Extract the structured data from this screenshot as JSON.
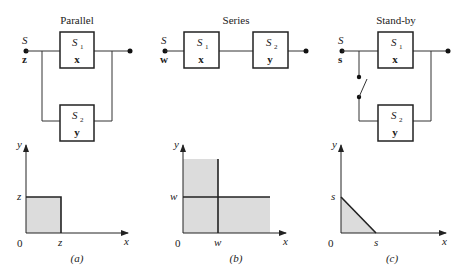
{
  "panels": [
    {
      "id": "a",
      "title": "Parallel",
      "caption": "(a)",
      "input_label": "S",
      "input_var": "z",
      "blocks": [
        {
          "name": "S",
          "sub": "1",
          "var": "x"
        },
        {
          "name": "S",
          "sub": "2",
          "var": "y"
        }
      ],
      "plot": {
        "x_axis": "x",
        "y_axis": "y",
        "origin": "0",
        "x_tick": "z",
        "y_tick": "z"
      }
    },
    {
      "id": "b",
      "title": "Series",
      "caption": "(b)",
      "input_label": "S",
      "input_var": "w",
      "blocks": [
        {
          "name": "S",
          "sub": "1",
          "var": "x"
        },
        {
          "name": "S",
          "sub": "2",
          "var": "y"
        }
      ],
      "plot": {
        "x_axis": "x",
        "y_axis": "y",
        "origin": "0",
        "x_tick": "w",
        "y_tick": "w"
      }
    },
    {
      "id": "c",
      "title": "Stand-by",
      "caption": "(c)",
      "input_label": "S",
      "input_var": "s",
      "blocks": [
        {
          "name": "S",
          "sub": "1",
          "var": "x"
        },
        {
          "name": "S",
          "sub": "2",
          "var": "y"
        }
      ],
      "plot": {
        "x_axis": "x",
        "y_axis": "y",
        "origin": "0",
        "x_tick": "s",
        "y_tick": "s"
      }
    }
  ],
  "colors": {
    "shade": "#dcdcdc",
    "line": "#222222"
  }
}
